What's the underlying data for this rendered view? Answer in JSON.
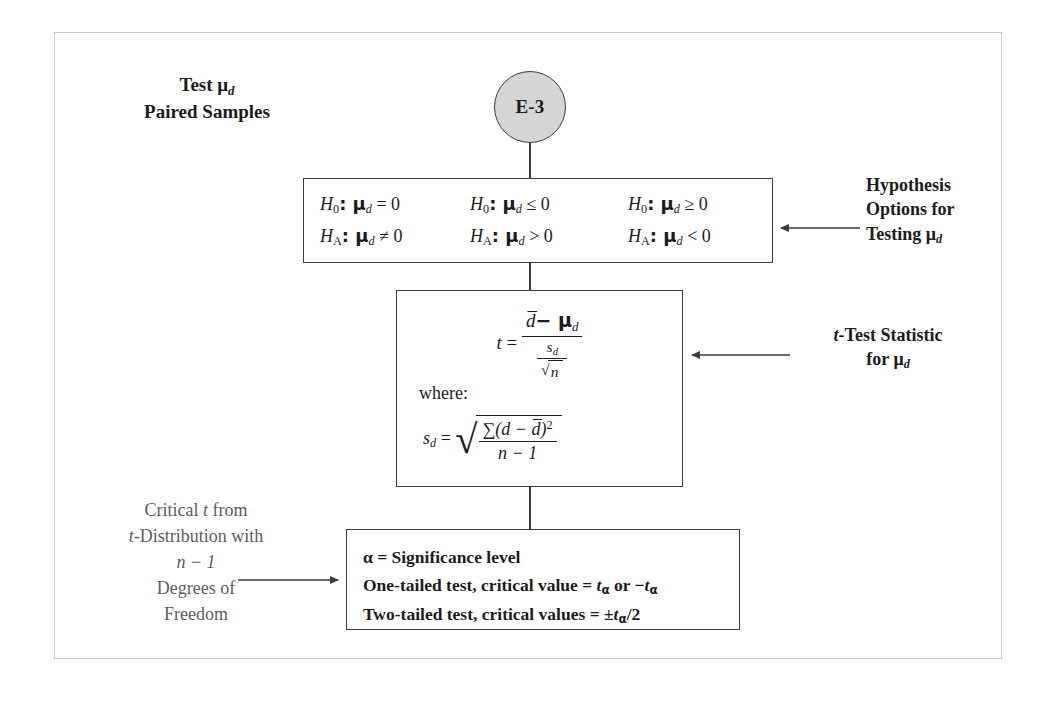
{
  "diagram": {
    "title_line1": "Test μ",
    "title_line1_sub": "d",
    "title_line2": "Paired Samples",
    "start_node_label": "E-3"
  },
  "hypothesis_box": {
    "columns": [
      {
        "null_prefix": "H",
        "null_sub": "0",
        "null_body": ": μ",
        "null_param_sub": "d",
        "null_rel": " = 0",
        "alt_prefix": "H",
        "alt_sub": "A",
        "alt_body": ": μ",
        "alt_param_sub": "d",
        "alt_rel": " ≠ 0"
      },
      {
        "null_prefix": "H",
        "null_sub": "0",
        "null_body": ": μ",
        "null_param_sub": "d",
        "null_rel": " ≤ 0",
        "alt_prefix": "H",
        "alt_sub": "A",
        "alt_body": ": μ",
        "alt_param_sub": "d",
        "alt_rel": " > 0"
      },
      {
        "null_prefix": "H",
        "null_sub": "0",
        "null_body": ": μ",
        "null_param_sub": "d",
        "null_rel": " ≥ 0",
        "alt_prefix": "H",
        "alt_sub": "A",
        "alt_body": ": μ",
        "alt_param_sub": "d",
        "alt_rel": " < 0"
      }
    ]
  },
  "formula_box": {
    "t_label": "t",
    "t_equals": "=",
    "numerator_dbar": "d̅",
    "numerator_minus": "− μ",
    "numerator_sub": "d",
    "denom_s": "s",
    "denom_s_sub": "d",
    "denom_sqrt_body": "n",
    "where_label": "where:",
    "sd_label": "s",
    "sd_sub": "d",
    "sd_equals": "=",
    "sd_num_sigma": "∑(d − d̅)",
    "sd_num_power": "2",
    "sd_den": "n − 1",
    "radical_glyph": "√"
  },
  "critical_box": {
    "line1": "α = Significance level",
    "line2_pre": "One-tailed test, critical value = ",
    "line2_t1": "t",
    "line2_sub1": "α",
    "line2_mid": " or −",
    "line2_t2": "t",
    "line2_sub2": "α",
    "line3_pre": "Two-tailed test, critical values = ±",
    "line3_t": "t",
    "line3_sub": "α",
    "line3_post": "/2"
  },
  "annotations": {
    "hypothesis_note": {
      "line1": "Hypothesis",
      "line2": "Options for",
      "line3": "Testing μ",
      "line3_sub": "d"
    },
    "tstat_note": {
      "line1_t": "t",
      "line1_rest": "-Test Statistic",
      "line2": "for μ",
      "line2_sub": "d"
    },
    "critical_note": {
      "line1_pre": "Critical ",
      "line1_t": "t",
      "line1_post": " from",
      "line2_t": "t",
      "line2_rest": "-Distribution with",
      "line3": "n − 1",
      "line4": "Degrees of",
      "line5": "Freedom"
    }
  },
  "colors": {
    "stroke": "#3a3a40",
    "circle_fill": "#d5d5d7",
    "frame": "#c9c9cd",
    "text": "#1c1c20",
    "muted_text": "#5c5c63"
  }
}
